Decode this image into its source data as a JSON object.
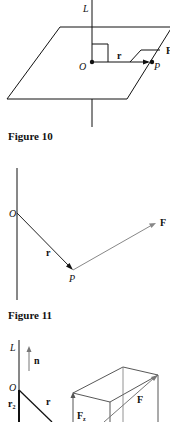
{
  "figures": [
    {
      "caption": "Figure 10",
      "labels": {
        "axis": "L",
        "origin": "O",
        "vector_r": "r",
        "point": "P",
        "plane_edge": "F"
      }
    },
    {
      "caption": "Figure 11",
      "labels": {
        "origin": "O",
        "vector_r": "r",
        "point": "P",
        "force": "F"
      }
    },
    {
      "caption": "",
      "labels": {
        "axis": "L",
        "normal": "n",
        "origin": "O",
        "r2": "r",
        "r2_sub": "2",
        "vector_r": "r",
        "force": "F",
        "force_component": "F",
        "force_component_sub": "z"
      }
    }
  ],
  "colors": {
    "ink": "#111111",
    "gray_vector": "#777777",
    "background": "#ffffff"
  }
}
